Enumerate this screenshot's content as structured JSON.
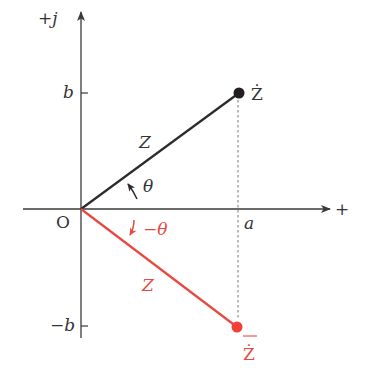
{
  "diagram": {
    "colors": {
      "axis": "#3a3a3a",
      "vector": "#2b2b2b",
      "conjugate": "#e8483f",
      "guide": "#777777"
    },
    "axes": {
      "imag_label": "+j",
      "real_label": "+",
      "origin_label": "O"
    },
    "ticks": {
      "b_label": "b",
      "neg_b_label": "−b",
      "a_label": "a"
    },
    "vector": {
      "label": "Z",
      "point_label": "Ż",
      "angle_label": "θ"
    },
    "conjugate": {
      "label": "Z",
      "point_label": "Ż",
      "point_overbar": true,
      "angle_label": "−θ"
    }
  }
}
